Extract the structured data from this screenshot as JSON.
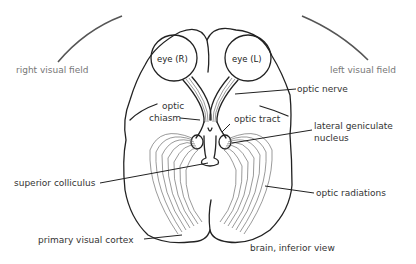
{
  "diagram": {
    "title": "brain, inferior view",
    "fields": {
      "right": "right visual field",
      "left": "left visual field"
    },
    "eyes": {
      "right": "eye (R)",
      "left": "eye (L)"
    },
    "labels": {
      "optic_chiasm_1": "optic",
      "optic_chiasm_2": "chiasm",
      "optic_nerve": "optic nerve",
      "optic_tract": "optic tract",
      "lgn_1": "lateral geniculate",
      "lgn_2": "nucleus",
      "superior_colliculus": "superior colliculus",
      "optic_radiations": "optic radiations",
      "primary_visual_cortex": "primary visual cortex",
      "brain_view": "brain, inferior view"
    },
    "colors": {
      "line": "#222222",
      "field_arc": "#555555",
      "field_text": "#777777"
    }
  }
}
